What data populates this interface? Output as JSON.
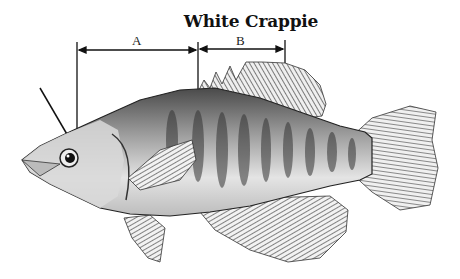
{
  "diagram": {
    "title": "White Crappie",
    "measurements": [
      {
        "label": "A",
        "x_start": 77,
        "x_end": 198,
        "y": 50
      },
      {
        "label": "B",
        "x_start": 198,
        "x_end": 285,
        "y": 49
      }
    ],
    "pointer_line": {
      "x1": 40,
      "y1": 88,
      "x2": 68,
      "y2": 136
    },
    "colors": {
      "ink": "#111111",
      "background": "#ffffff",
      "body_light": "#d8d8d8",
      "body_dark": "#555555"
    }
  }
}
